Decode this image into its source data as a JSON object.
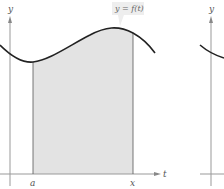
{
  "figure": {
    "type": "area-under-curve",
    "function_label": "y = f(t)",
    "y_axis_label": "y",
    "x_axis_label": "t",
    "lower_bound_label": "a",
    "upper_bound_label": "x",
    "second_panel_y_axis_label": "y",
    "colors": {
      "background": "#ffffff",
      "curve": "#222222",
      "axis": "#999999",
      "shade": "#e3e3e3",
      "bound_line": "#555555"
    }
  }
}
